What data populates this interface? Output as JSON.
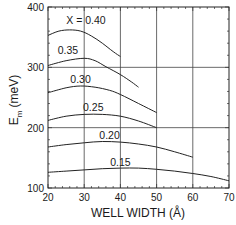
{
  "chart_data": {
    "type": "line",
    "title": "",
    "xlabel": "WELL WIDTH (Å)",
    "ylabel_main": "E",
    "ylabel_sub": "m",
    "ylabel_unit": "(meV)",
    "xlim": [
      20,
      70
    ],
    "ylim": [
      100,
      400
    ],
    "xticks": [
      20,
      30,
      40,
      50,
      60,
      70
    ],
    "yticks": [
      100,
      200,
      300,
      400
    ],
    "x_gridlines": [
      30,
      40,
      50,
      60
    ],
    "y_gridlines": [
      200,
      300
    ],
    "grid": true,
    "legend": "inline labels",
    "series": [
      {
        "name": "X = 0.40",
        "label": "X = 0.40",
        "label_pos": [
          30.5,
          372
        ],
        "x": [
          20,
          23,
          26,
          29,
          32,
          35,
          38,
          40
        ],
        "y": [
          353,
          360,
          362,
          360,
          352,
          340,
          326,
          318
        ]
      },
      {
        "name": "0.35",
        "label": "0.35",
        "label_pos": [
          25.5,
          322
        ],
        "x": [
          20,
          25,
          30,
          33,
          36,
          40,
          43,
          45
        ],
        "y": [
          303,
          311,
          315,
          311,
          301,
          288,
          276,
          267
        ]
      },
      {
        "name": "0.30",
        "label": "0.30",
        "label_pos": [
          29,
          274
        ],
        "x": [
          20,
          25,
          29,
          33,
          37,
          40,
          45,
          50
        ],
        "y": [
          258,
          266,
          269,
          267,
          262,
          255,
          240,
          225
        ]
      },
      {
        "name": "0.25",
        "label": "0.25",
        "label_pos": [
          32.5,
          227
        ],
        "x": [
          20,
          25,
          30,
          35,
          40,
          45,
          50
        ],
        "y": [
          212,
          219,
          222,
          222,
          219,
          211,
          200
        ]
      },
      {
        "name": "0.20",
        "label": "0.20",
        "label_pos": [
          37,
          181
        ],
        "x": [
          20,
          25,
          30,
          35,
          40,
          45,
          50,
          55,
          60
        ],
        "y": [
          168,
          172,
          175,
          177,
          176,
          173,
          168,
          160,
          151
        ]
      },
      {
        "name": "0.15",
        "label": "0.15",
        "label_pos": [
          40,
          136
        ],
        "x": [
          20,
          25,
          30,
          35,
          40,
          45,
          50,
          55,
          60,
          65,
          70
        ],
        "y": [
          126,
          128,
          130,
          132,
          133,
          133,
          131,
          128,
          124,
          119,
          112
        ]
      }
    ]
  }
}
